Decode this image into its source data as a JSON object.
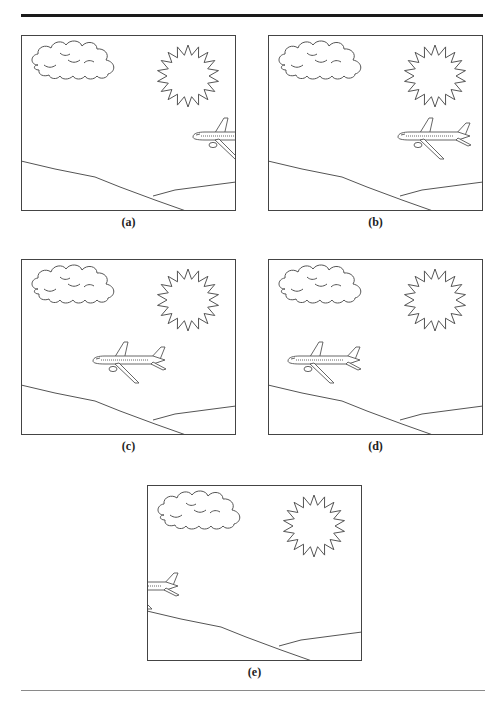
{
  "figure": {
    "panels": [
      {
        "id": "a",
        "label": "(a)",
        "left": 21,
        "top": 35,
        "plane_x": 170,
        "plane_y": 102
      },
      {
        "id": "b",
        "label": "(b)",
        "left": 268,
        "top": 35,
        "plane_x": 128,
        "plane_y": 102
      },
      {
        "id": "c",
        "label": "(c)",
        "left": 21,
        "top": 259,
        "plane_x": 70,
        "plane_y": 102
      },
      {
        "id": "d",
        "label": "(d)",
        "left": 268,
        "top": 259,
        "plane_x": 18,
        "plane_y": 102
      },
      {
        "id": "e",
        "label": "(e)",
        "left": 147,
        "top": 485,
        "plane_x": -43,
        "plane_y": 102
      }
    ],
    "scene_elements": [
      "cloud",
      "sun",
      "airplane",
      "hills"
    ],
    "colors": {
      "stroke": "#555555",
      "frame": "#444444",
      "background": "#ffffff"
    }
  }
}
